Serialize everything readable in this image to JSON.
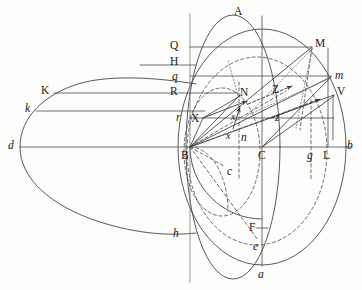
{
  "figure": {
    "canvas": {
      "width": 362,
      "height": 290
    },
    "background_color": "#fdfdfb",
    "stroke_color": "#3b3b3b",
    "dash_color": "#4a4a4a"
  },
  "labels": [
    {
      "id": "A",
      "text": "A",
      "style": "roman",
      "x": 234,
      "y": 6,
      "name": "point-label-A"
    },
    {
      "id": "Q",
      "text": "Q",
      "style": "roman",
      "x": 170,
      "y": 40,
      "name": "point-label-Q"
    },
    {
      "id": "M",
      "text": "M",
      "style": "roman",
      "x": 315,
      "y": 38,
      "name": "point-label-M"
    },
    {
      "id": "H",
      "text": "H",
      "style": "roman",
      "x": 170,
      "y": 56,
      "name": "point-label-H"
    },
    {
      "id": "q",
      "text": "q",
      "style": "italic",
      "x": 172,
      "y": 71,
      "name": "point-label-q"
    },
    {
      "id": "m",
      "text": "m",
      "style": "italic",
      "x": 335,
      "y": 70,
      "name": "point-label-m"
    },
    {
      "id": "K",
      "text": "K",
      "style": "roman",
      "x": 41,
      "y": 85,
      "name": "point-label-K"
    },
    {
      "id": "R",
      "text": "R",
      "style": "roman",
      "x": 170,
      "y": 86,
      "name": "point-label-R"
    },
    {
      "id": "N",
      "text": "N",
      "style": "roman",
      "x": 240,
      "y": 87,
      "name": "point-label-N"
    },
    {
      "id": "Z",
      "text": "Z",
      "style": "roman",
      "x": 272,
      "y": 84,
      "name": "point-label-Z"
    },
    {
      "id": "V",
      "text": "V",
      "style": "roman",
      "x": 337,
      "y": 86,
      "name": "point-label-V"
    },
    {
      "id": "k",
      "text": "k",
      "style": "italic",
      "x": 25,
      "y": 103,
      "name": "point-label-k"
    },
    {
      "id": "r",
      "text": "r",
      "style": "italic",
      "x": 176,
      "y": 112,
      "name": "point-label-r"
    },
    {
      "id": "X",
      "text": "X",
      "style": "roman",
      "x": 191,
      "y": 113,
      "name": "point-label-X"
    },
    {
      "id": "xi",
      "text": "x",
      "style": "italic",
      "x": 231,
      "y": 112,
      "name": "point-label-x-upper"
    },
    {
      "id": "zi",
      "text": "z",
      "style": "italic",
      "x": 275,
      "y": 112,
      "name": "point-label-z"
    },
    {
      "id": "d",
      "text": "d",
      "style": "italic",
      "x": 8,
      "y": 140,
      "name": "point-label-d"
    },
    {
      "id": "x2",
      "text": "x",
      "style": "italic",
      "x": 226,
      "y": 131,
      "name": "point-label-x-lower"
    },
    {
      "id": "n",
      "text": "n",
      "style": "italic",
      "x": 241,
      "y": 132,
      "name": "point-label-n"
    },
    {
      "id": "b",
      "text": "b",
      "style": "italic",
      "x": 347,
      "y": 140,
      "name": "point-label-b"
    },
    {
      "id": "B",
      "text": "B",
      "style": "roman",
      "x": 181,
      "y": 150,
      "name": "point-label-B"
    },
    {
      "id": "C",
      "text": "C",
      "style": "roman",
      "x": 258,
      "y": 150,
      "name": "point-label-C"
    },
    {
      "id": "g",
      "text": "g",
      "style": "italic",
      "x": 307,
      "y": 150,
      "name": "point-label-g"
    },
    {
      "id": "L",
      "text": "L",
      "style": "roman",
      "x": 323,
      "y": 150,
      "name": "point-label-L"
    },
    {
      "id": "c",
      "text": "c",
      "style": "italic",
      "x": 227,
      "y": 166,
      "name": "point-label-c"
    },
    {
      "id": "h",
      "text": "h",
      "style": "italic",
      "x": 173,
      "y": 228,
      "name": "point-label-h"
    },
    {
      "id": "F",
      "text": "F",
      "style": "roman",
      "x": 249,
      "y": 222,
      "name": "point-label-F"
    },
    {
      "id": "e",
      "text": "e",
      "style": "italic",
      "x": 253,
      "y": 241,
      "name": "point-label-e"
    },
    {
      "id": "a",
      "text": "a",
      "style": "italic",
      "x": 258,
      "y": 269,
      "name": "point-label-a"
    }
  ],
  "geometry": {
    "vertical_axis": {
      "x": 190,
      "y1": 14,
      "y2": 282,
      "name": "vertical-axis-line"
    },
    "center_axis": {
      "x": 262,
      "y1": 14,
      "y2": 280,
      "name": "center-vertical-axis"
    },
    "baseline": {
      "x1": 14,
      "x2": 352,
      "y": 147,
      "name": "horizontal-baseline-db"
    },
    "points": {
      "A": [
        237,
        16
      ],
      "B": [
        190,
        147
      ],
      "C": [
        262,
        147
      ],
      "a": [
        262,
        264
      ],
      "d": [
        20,
        147
      ],
      "b": [
        345,
        147
      ],
      "L": [
        328,
        147
      ],
      "g": [
        311,
        147
      ],
      "M": [
        312,
        47
      ],
      "m": [
        330,
        76
      ],
      "V": [
        333,
        94
      ],
      "N": [
        238,
        97
      ],
      "X": [
        203,
        118
      ],
      "Z": [
        268,
        93
      ],
      "Q": [
        190,
        47
      ],
      "H": [
        190,
        65
      ],
      "q": [
        190,
        76
      ],
      "R": [
        190,
        93
      ],
      "r": [
        190,
        118
      ],
      "K": [
        54,
        93
      ],
      "k": [
        36,
        111
      ],
      "h": [
        183,
        233
      ],
      "F": [
        262,
        228
      ],
      "e": [
        262,
        243
      ],
      "c": [
        222,
        170
      ],
      "n": [
        239,
        127
      ]
    },
    "ellipses": {
      "outer_big": {
        "cx": 262,
        "cy": 147,
        "rx": 84,
        "ry": 118,
        "name": "outer-large-ellipse"
      },
      "left_sphere": {
        "cx": 232,
        "cy": 147,
        "rx": 46,
        "ry": 131,
        "name": "main-sphere-ellipse"
      },
      "flat_left": {
        "cx": 118,
        "cy": 140,
        "rx": 100,
        "ry": 50,
        "name": "left-flat-ellipse"
      },
      "inner_dash": {
        "cx": 257,
        "cy": 150,
        "rx": 70,
        "ry": 94,
        "name": "inner-dashed-ellipse"
      },
      "small_dash": {
        "cx": 222,
        "cy": 150,
        "rx": 38,
        "ry": 64,
        "name": "small-dashed-ellipse"
      }
    },
    "arrows": [
      {
        "from": [
          203,
          118
        ],
        "to": [
          245,
          103
        ],
        "name": "vector-arrow-X-upper",
        "style": "solid"
      },
      {
        "from": [
          245,
          105
        ],
        "to": [
          290,
          86
        ],
        "name": "vector-arrow-Z-upper",
        "style": "dashed"
      },
      {
        "from": [
          233,
          127
        ],
        "to": [
          239,
          108
        ],
        "name": "vector-arrow-n-vertical",
        "style": "solid"
      },
      {
        "from": [
          270,
          116
        ],
        "to": [
          318,
          98
        ],
        "name": "vector-arrow-z-lower",
        "style": "dashed"
      }
    ]
  }
}
